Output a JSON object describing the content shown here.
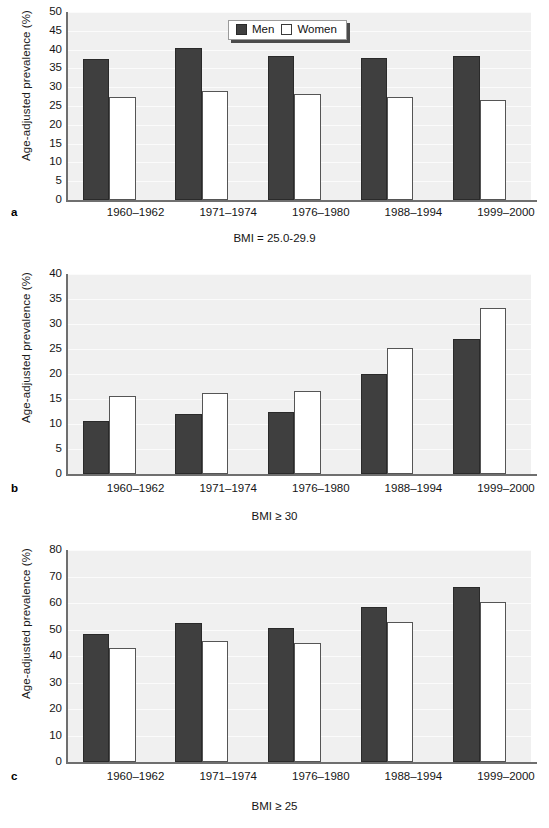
{
  "figure": {
    "y_axis_title": "Age-adjusted prevalence (%)",
    "legend": {
      "position": "top-center-right",
      "entries": [
        {
          "key": "men",
          "label": "Men",
          "color": "#3f3f3f",
          "swatch": "filled-square"
        },
        {
          "key": "women",
          "label": "Women",
          "color": "#ffffff",
          "swatch": "open-square"
        }
      ]
    },
    "panels": [
      {
        "letter": "a",
        "caption": "BMI = 25.0-29.9"
      },
      {
        "letter": "b",
        "caption": "BMI ≥ 30"
      },
      {
        "letter": "c",
        "caption": "BMI ≥ 25"
      }
    ]
  },
  "chart_data": [
    {
      "id": "panel-a",
      "type": "bar",
      "panel_letter": "a",
      "title": "BMI = 25.0-29.9",
      "xlabel": "",
      "ylabel": "Age-adjusted prevalence (%)",
      "categories": [
        "1960–1962",
        "1971–1974",
        "1976–1980",
        "1988–1994",
        "1999–2000"
      ],
      "series": [
        {
          "name": "Men",
          "values": [
            37.5,
            40.5,
            38.2,
            37.9,
            38.4
          ]
        },
        {
          "name": "Women",
          "values": [
            27.3,
            29.0,
            28.3,
            27.5,
            26.6
          ]
        }
      ],
      "ylim": [
        0,
        50
      ],
      "yticks": [
        0,
        5,
        10,
        15,
        20,
        25,
        30,
        35,
        40,
        45,
        50
      ],
      "grid": true,
      "legend": "top-right"
    },
    {
      "id": "panel-b",
      "type": "bar",
      "panel_letter": "b",
      "title": "BMI ≥ 30",
      "xlabel": "",
      "ylabel": "Age-adjusted prevalence (%)",
      "categories": [
        "1960–1962",
        "1971–1974",
        "1976–1980",
        "1988–1994",
        "1999–2000"
      ],
      "series": [
        {
          "name": "Men",
          "values": [
            10.7,
            12.1,
            12.5,
            20.0,
            27.1
          ]
        },
        {
          "name": "Women",
          "values": [
            15.7,
            16.3,
            16.6,
            25.2,
            33.3
          ]
        }
      ],
      "ylim": [
        0,
        40
      ],
      "yticks": [
        0,
        5,
        10,
        15,
        20,
        25,
        30,
        35,
        40
      ],
      "grid": true,
      "legend": "none"
    },
    {
      "id": "panel-c",
      "type": "bar",
      "panel_letter": "c",
      "title": "BMI ≥ 25",
      "xlabel": "",
      "ylabel": "Age-adjusted prevalence (%)",
      "categories": [
        "1960–1962",
        "1971–1974",
        "1976–1980",
        "1988–1994",
        "1999–2000"
      ],
      "series": [
        {
          "name": "Men",
          "values": [
            48.2,
            52.4,
            50.7,
            58.4,
            66.0
          ]
        },
        {
          "name": "Women",
          "values": [
            43.0,
            45.5,
            45.1,
            53.0,
            60.5
          ]
        }
      ],
      "ylim": [
        0,
        80
      ],
      "yticks": [
        0,
        10,
        20,
        30,
        40,
        50,
        60,
        70,
        80
      ],
      "grid": true,
      "legend": "none"
    }
  ],
  "colors": {
    "men_bar": "#3f3f3f",
    "women_bar": "#ffffff",
    "plot_background": "#f0f0f0",
    "axis": "#6f6f6f",
    "gridline": "#fbfbfb",
    "text": "#151515"
  }
}
